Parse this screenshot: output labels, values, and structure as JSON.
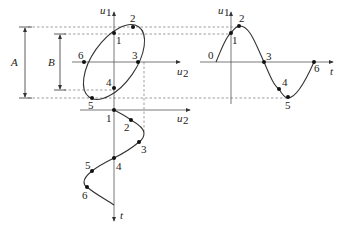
{
  "diagram": {
    "type": "lissajous-ellipse-projection",
    "dimension_labels": {
      "A": "A",
      "B": "B"
    },
    "ellipse_plot": {
      "vertical_axis": "u",
      "vertical_axis_sub": "1",
      "horizontal_axis": "u",
      "horizontal_axis_sub": "2",
      "points": [
        "1",
        "2",
        "3",
        "4",
        "5",
        "6"
      ]
    },
    "u1_time_plot": {
      "vertical_axis": "u",
      "vertical_axis_sub": "1",
      "time_axis": "t",
      "points": [
        "0",
        "1",
        "2",
        "3",
        "4",
        "5",
        "6"
      ]
    },
    "u2_time_plot": {
      "horizontal_axis": "u",
      "horizontal_axis_sub": "2",
      "time_axis": "t",
      "points": [
        "1",
        "2",
        "3",
        "4",
        "5",
        "6"
      ]
    }
  }
}
